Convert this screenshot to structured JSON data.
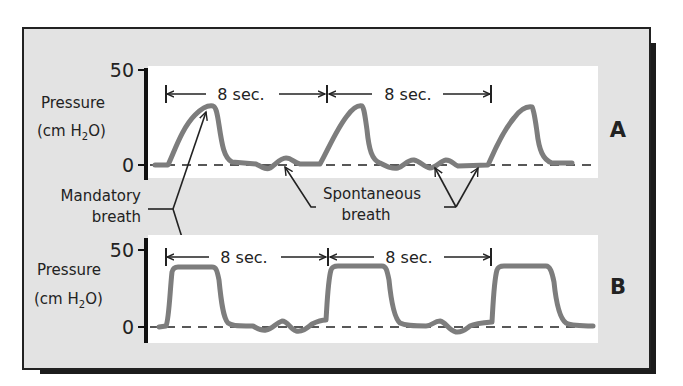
{
  "figure": {
    "panels": [
      {
        "id": "A",
        "label": "A",
        "y_axis": {
          "title_line1": "Pressure",
          "title_line2_prefix": "(cm H",
          "title_line2_sub": "2",
          "title_line2_suffix": "O)",
          "tick_top": "50",
          "tick_bottom": "0"
        },
        "intervals": [
          "8 sec.",
          "8 sec."
        ],
        "waveform": "pressure-limited mandatory breaths (rounded peaks ~30 cm H2O) with spontaneous breaths between"
      },
      {
        "id": "B",
        "label": "B",
        "y_axis": {
          "title_line1": "Pressure",
          "title_line2_prefix": "(cm H",
          "title_line2_sub": "2",
          "title_line2_suffix": "O)",
          "tick_top": "50",
          "tick_bottom": "0"
        },
        "intervals": [
          "8 sec.",
          "8 sec."
        ],
        "waveform": "square (plateau ~38 cm H2O) mandatory breaths with spontaneous breaths between"
      }
    ],
    "annotations": {
      "mandatory_line1": "Mandatory",
      "mandatory_line2": "breath",
      "spontaneous_line1": "Spontaneous",
      "spontaneous_line2": "breath"
    },
    "colors": {
      "background": "#e3e3e3",
      "plot_area": "#ffffff",
      "waveform": "#7d7d7d",
      "ink": "#222222"
    }
  }
}
